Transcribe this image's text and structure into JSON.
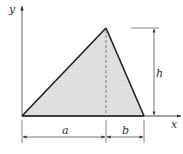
{
  "diagram": {
    "title": "",
    "type": "triangle-with-dimensions",
    "axes": {
      "x_label": "x",
      "y_label": "y"
    },
    "triangle": {
      "vertices": [
        [
          0,
          0
        ],
        [
          "a",
          "h"
        ],
        [
          "a+b",
          0
        ]
      ],
      "fill": "#e2e2e2",
      "stroke": "#222222"
    },
    "dimensions": {
      "a_label": "a",
      "b_label": "b",
      "h_label": "h"
    },
    "colors": {
      "line": "#222222",
      "fill": "#e2e2e2",
      "dim": "#444444"
    }
  }
}
